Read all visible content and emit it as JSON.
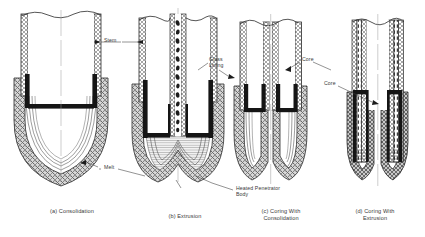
{
  "figure": {
    "background_color": "#ffffff",
    "ink_color": "#2b2b2b"
  },
  "panels": [
    {
      "id": "a",
      "caption_lines": [
        "(a) Consolidation"
      ],
      "caption_x": 30,
      "caption_y": 208,
      "caption_w": 84,
      "description": "Closed hemispherical penetrator tip consolidating melt into surrounding rock"
    },
    {
      "id": "b",
      "caption_lines": [
        "(b) Extrusion"
      ],
      "caption_x": 148,
      "caption_y": 213,
      "caption_w": 74,
      "description": "Penetrator extruding melt upward through a central stem channel"
    },
    {
      "id": "c",
      "caption_lines": [
        "(c) Coring With",
        "Consolidation"
      ],
      "caption_x": 238,
      "caption_y": 208,
      "caption_w": 86,
      "description": "Annular coring penetrator leaving a rock core, melt consolidated into walls"
    },
    {
      "id": "d",
      "caption_lines": [
        "(d) Coring With",
        "Extrusion"
      ],
      "caption_x": 332,
      "caption_y": 208,
      "caption_w": 86,
      "description": "Annular coring penetrator with melt extruded up the annulus"
    }
  ],
  "callouts": [
    {
      "name": "stem",
      "text": "Stem",
      "x": 104,
      "y": 40,
      "lines": 1
    },
    {
      "name": "melt",
      "text": "Melt",
      "x": 104,
      "y": 165,
      "lines": 1
    },
    {
      "name": "glass-lining",
      "text": "Glass\nLining",
      "text_line1": "Glass",
      "text_line2": "Lining",
      "x": 209,
      "y": 59,
      "lines": 2
    },
    {
      "name": "core-c",
      "text": "Core",
      "x": 302,
      "y": 59,
      "lines": 1
    },
    {
      "name": "core-d",
      "text": "Core",
      "x": 327,
      "y": 83,
      "lines": 1
    },
    {
      "name": "heated-penetrator",
      "text": "Heated Penetrator",
      "text_line1": "Heated Penetrator",
      "text_line2": "Body",
      "x": 186,
      "y": 188,
      "lines": 2
    }
  ],
  "legend_terms": {
    "stem": "Stem",
    "melt": "Melt",
    "glass_lining_1": "Glass",
    "glass_lining_2": "Lining",
    "core": "Core",
    "heated_penetrator_1": "Heated Penetrator",
    "heated_penetrator_2": "Body"
  }
}
